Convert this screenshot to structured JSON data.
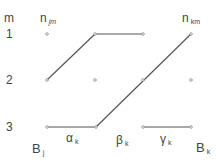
{
  "header": {
    "row_label": "m",
    "left_col": "n",
    "left_col_sub": "jm",
    "right_col": "n",
    "right_col_sub": "km"
  },
  "rows": [
    "1",
    "2",
    "3"
  ],
  "labels": {
    "bj": "B",
    "bj_sub": "j",
    "bk": "B",
    "bk_sub": "k",
    "alpha": "α",
    "alpha_sub": "k",
    "beta": "β",
    "beta_sub": "k",
    "gamma": "γ",
    "gamma_sub": "k"
  },
  "colors": {
    "line": "#555555",
    "text": "#444444"
  }
}
